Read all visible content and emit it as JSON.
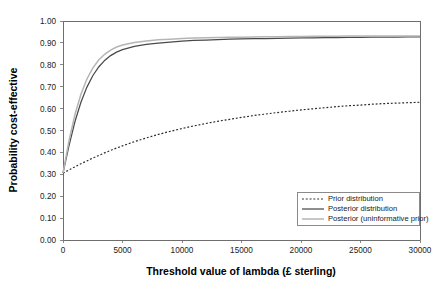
{
  "chart_data": {
    "type": "line",
    "title": "",
    "xlabel": "Threshold value of lambda (£ sterling)",
    "ylabel": "Probability cost-effective",
    "xlim": [
      0,
      30000
    ],
    "ylim": [
      0,
      1.0
    ],
    "grid": false,
    "legend_position": "bottom-right",
    "x_ticks": [
      0,
      5000,
      10000,
      15000,
      20000,
      25000,
      30000
    ],
    "x_tick_labels": [
      "0",
      "5000",
      "10000",
      "15000",
      "20000",
      "25000",
      "30000"
    ],
    "y_ticks": [
      0.0,
      0.1,
      0.2,
      0.3,
      0.4,
      0.5,
      0.6,
      0.7,
      0.8,
      0.9,
      1.0
    ],
    "y_tick_labels": [
      "0.00",
      "0.10",
      "0.20",
      "0.30",
      "0.40",
      "0.50",
      "0.60",
      "0.70",
      "0.80",
      "0.90",
      "1.00"
    ],
    "x": [
      0,
      500,
      1000,
      1500,
      2000,
      2500,
      3000,
      3500,
      4000,
      4500,
      5000,
      6000,
      7000,
      8000,
      9000,
      10000,
      11000,
      12000,
      13000,
      14000,
      15000,
      16000,
      17000,
      18000,
      19000,
      20000,
      21000,
      22000,
      23000,
      24000,
      25000,
      26000,
      27000,
      28000,
      29000,
      30000
    ],
    "series": [
      {
        "name": "Prior distribution",
        "style": "dotted",
        "color": "#2b2b2b",
        "values": [
          0.305,
          0.32,
          0.334,
          0.348,
          0.361,
          0.374,
          0.386,
          0.398,
          0.409,
          0.42,
          0.43,
          0.449,
          0.466,
          0.482,
          0.496,
          0.509,
          0.521,
          0.532,
          0.542,
          0.551,
          0.56,
          0.568,
          0.575,
          0.582,
          0.588,
          0.594,
          0.599,
          0.604,
          0.609,
          0.613,
          0.616,
          0.62,
          0.623,
          0.625,
          0.627,
          0.629
        ]
      },
      {
        "name": "Posterior distribution",
        "style": "solid",
        "color": "#4a4a4a",
        "values": [
          0.305,
          0.43,
          0.54,
          0.628,
          0.697,
          0.75,
          0.79,
          0.82,
          0.842,
          0.858,
          0.869,
          0.884,
          0.893,
          0.899,
          0.904,
          0.908,
          0.911,
          0.913,
          0.915,
          0.917,
          0.918,
          0.919,
          0.92,
          0.921,
          0.922,
          0.923,
          0.923,
          0.924,
          0.924,
          0.925,
          0.925,
          0.926,
          0.926,
          0.926,
          0.927,
          0.927
        ]
      },
      {
        "name": "Posterior (uninformative prior)",
        "style": "solid",
        "color": "#b5b5b5",
        "values": [
          0.305,
          0.452,
          0.572,
          0.664,
          0.734,
          0.785,
          0.822,
          0.848,
          0.867,
          0.881,
          0.89,
          0.902,
          0.909,
          0.914,
          0.917,
          0.92,
          0.922,
          0.923,
          0.925,
          0.926,
          0.926,
          0.927,
          0.928,
          0.928,
          0.929,
          0.929,
          0.93,
          0.93,
          0.93,
          0.931,
          0.931,
          0.931,
          0.932,
          0.932,
          0.932,
          0.932
        ]
      }
    ],
    "legend": [
      {
        "label": "Prior distribution",
        "style": "dotted",
        "color": "#2b2b2b"
      },
      {
        "label": "Posterior distribution",
        "style": "solid",
        "color": "#4a4a4a"
      },
      {
        "label": "Posterior (uninformative prior)",
        "style": "solid",
        "color": "#b5b5b5"
      }
    ]
  }
}
